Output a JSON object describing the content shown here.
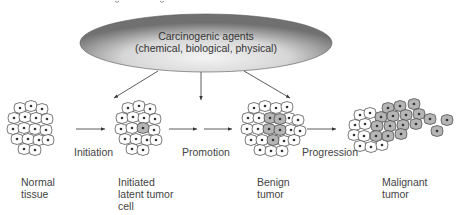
{
  "header": {
    "cropped_title_fragment": "...ogic ...g..."
  },
  "agent_box": {
    "line1": "Carcinogenic agents",
    "line2": "(chemical, biological, physical)"
  },
  "stages": [
    {
      "id": "normal",
      "label": "Normal\ntissue"
    },
    {
      "id": "initiated",
      "label": "Initiated\nlatent tumor\ncell"
    },
    {
      "id": "benign",
      "label": "Benign\ntumor"
    },
    {
      "id": "malignant",
      "label": "Malignant\ntumor"
    }
  ],
  "transitions": [
    {
      "label": "Initiation"
    },
    {
      "label": "Promotion"
    },
    {
      "label": "Progression"
    }
  ],
  "colors": {
    "ellipse_dark": "#6e6e6e",
    "ellipse_light": "#f2f2f2",
    "tumor_cell_fill": "#b5b5b5",
    "line": "#333333"
  }
}
